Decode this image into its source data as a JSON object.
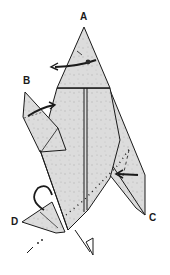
{
  "diagram": {
    "type": "origami-folding-step",
    "labels": {
      "A": "A",
      "B": "B",
      "C": "C",
      "D": "D"
    },
    "colors": {
      "paper": "#dcdcdc",
      "paper_speckle": "#b9b9b9",
      "line": "#1a1a1a",
      "background": "#ffffff"
    },
    "instructions": [
      {
        "label": "A",
        "action": "fold-arrow-left"
      },
      {
        "label": "B",
        "action": "fold-arrow-right"
      },
      {
        "label": "C",
        "action": "push-in-arrow-left"
      },
      {
        "label": "D",
        "action": "turn-over-loop-arrow"
      }
    ]
  }
}
